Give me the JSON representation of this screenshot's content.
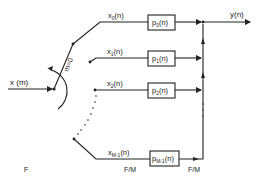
{
  "diagram": {
    "type": "polyphase-filter-commutator",
    "input": {
      "label": "x (m)"
    },
    "output": {
      "label": "y(n)"
    },
    "switch": {
      "label": "m=0"
    },
    "branches": [
      {
        "signal": "x",
        "sub": "0",
        "box_main": "p",
        "box_sub": "0",
        "box_tail": "(n)",
        "sig_tail": "(n)"
      },
      {
        "signal": "x",
        "sub": "1",
        "box_main": "p",
        "box_sub": "1",
        "box_tail": "(n)",
        "sig_tail": "(n)"
      },
      {
        "signal": "x",
        "sub": "2",
        "box_main": "p",
        "box_sub": "2",
        "box_tail": "(n)",
        "sig_tail": "(n)"
      },
      {
        "signal": "x",
        "sub": "M-1",
        "box_main": "p",
        "box_sub": "M-1",
        "box_tail": "(n)",
        "sig_tail": "(n)"
      }
    ],
    "rate_labels": {
      "input_rate": "F",
      "branch_rate_before": "F/M",
      "branch_rate_after": "F/M"
    }
  }
}
